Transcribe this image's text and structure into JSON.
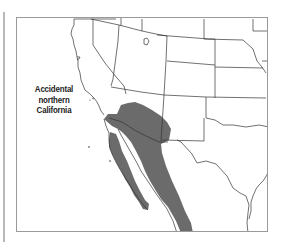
{
  "map": {
    "title": "Range map",
    "annotation": {
      "line1": "Accidental",
      "line2": "northern",
      "line3": "California"
    },
    "colors": {
      "range_fill": "#6b6b6b",
      "boundary": "#333333",
      "frame": "#9a9a9a",
      "background": "#ffffff"
    },
    "regions_shown": [
      "California",
      "Nevada",
      "Oregon",
      "Idaho",
      "Utah",
      "Arizona",
      "Wyoming",
      "Colorado",
      "New Mexico",
      "Nebraska",
      "Kansas",
      "Oklahoma",
      "Texas",
      "Iowa",
      "Missouri",
      "Baja California",
      "Sonora",
      "Sinaloa"
    ],
    "legend": {
      "range": "Year-round range (Sonoran Desert / Gulf of California region)"
    }
  }
}
